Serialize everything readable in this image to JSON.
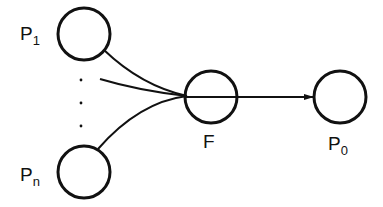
{
  "diagram": {
    "type": "network-flow",
    "nodes": [
      {
        "id": "p1",
        "label": "P",
        "subscript": "1"
      },
      {
        "id": "pn",
        "label": "P",
        "subscript": "n"
      },
      {
        "id": "f",
        "label": "F",
        "subscript": ""
      },
      {
        "id": "p0",
        "label": "P",
        "subscript": "0"
      }
    ],
    "edges": [
      {
        "from": "p1",
        "to": "f",
        "arrow": false
      },
      {
        "from": "ellipsis",
        "to": "f",
        "arrow": false
      },
      {
        "from": "pn",
        "to": "f",
        "arrow": false
      },
      {
        "from": "f",
        "to": "p0",
        "arrow": true
      }
    ],
    "ellipsis": "vertical dots (inputs P2 … Pn-1)"
  }
}
